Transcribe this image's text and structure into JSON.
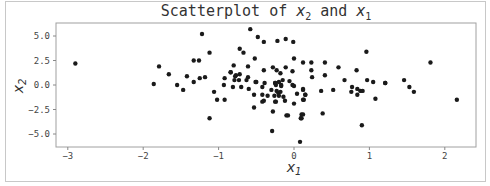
{
  "chart_data": {
    "type": "scatter",
    "title": "Scatterplot of x2 and x1",
    "xlabel": "x1",
    "ylabel": "x2",
    "xlim": [
      -3.15,
      2.4
    ],
    "ylim": [
      -6.3,
      6.3
    ],
    "xticks": [
      -3,
      -2,
      -1,
      0,
      1,
      2
    ],
    "yticks": [
      5.0,
      2.5,
      0.0,
      -2.5,
      -5.0
    ],
    "xtick_labels": [
      "−3",
      "−2",
      "−1",
      "0",
      "1",
      "2"
    ],
    "ytick_labels": [
      "5.0",
      "2.5",
      "0.0",
      "−2.5",
      "−5.0"
    ],
    "grid": false,
    "marker_color": "#1a1a1a",
    "points": [
      [
        -2.9,
        2.2
      ],
      [
        -1.86,
        0.1
      ],
      [
        -1.79,
        1.9
      ],
      [
        -1.66,
        1.1
      ],
      [
        -1.55,
        0.0
      ],
      [
        -1.47,
        -0.5
      ],
      [
        -1.42,
        0.9
      ],
      [
        -1.33,
        0.3
      ],
      [
        -1.33,
        2.5
      ],
      [
        -1.26,
        2.5
      ],
      [
        -1.22,
        5.2
      ],
      [
        -1.12,
        3.3
      ],
      [
        -1.25,
        0.7
      ],
      [
        -1.18,
        0.8
      ],
      [
        -1.06,
        -0.7
      ],
      [
        -1.02,
        -1.5
      ],
      [
        -1.12,
        -3.4
      ],
      [
        -0.92,
        -1.5
      ],
      [
        -0.93,
        0.0
      ],
      [
        -0.92,
        0.7
      ],
      [
        -0.84,
        1.3
      ],
      [
        -0.77,
        1.0
      ],
      [
        -0.8,
        2.0
      ],
      [
        -0.73,
        0.5
      ],
      [
        -0.79,
        0.5
      ],
      [
        -0.58,
        5.7
      ],
      [
        -0.48,
        4.9
      ],
      [
        -0.4,
        4.4
      ],
      [
        -0.72,
        3.7
      ],
      [
        -0.67,
        3.3
      ],
      [
        -0.52,
        2.7
      ],
      [
        -0.61,
        1.9
      ],
      [
        -0.4,
        1.5
      ],
      [
        -0.84,
        1.3
      ],
      [
        -0.72,
        1.1
      ],
      [
        -0.78,
        0.9
      ],
      [
        -0.61,
        0.8
      ],
      [
        -0.5,
        0.3
      ],
      [
        -0.7,
        -0.2
      ],
      [
        -0.63,
        0.5
      ],
      [
        -0.81,
        -0.2
      ],
      [
        -0.6,
        -0.4
      ],
      [
        -0.42,
        -0.2
      ],
      [
        -0.39,
        0.2
      ],
      [
        -0.51,
        0.3
      ],
      [
        -0.53,
        -1.0
      ],
      [
        -0.42,
        -1.7
      ],
      [
        -0.4,
        -1.6
      ],
      [
        -0.42,
        -1.0
      ],
      [
        -0.53,
        -2.3
      ],
      [
        -0.23,
        1.5
      ],
      [
        -0.11,
        1.8
      ],
      [
        -0.2,
        0.3
      ],
      [
        -0.24,
        0.0
      ],
      [
        -0.21,
        -0.8
      ],
      [
        -0.26,
        -1.1
      ],
      [
        -0.3,
        -0.5
      ],
      [
        -0.25,
        -1.7
      ],
      [
        -0.18,
        -0.7
      ],
      [
        -0.14,
        -1.2
      ],
      [
        -0.12,
        -1.6
      ],
      [
        -0.22,
        4.5
      ],
      [
        -0.11,
        4.7
      ],
      [
        -0.01,
        4.4
      ],
      [
        0.0,
        2.7
      ],
      [
        0.12,
        2.3
      ],
      [
        -0.28,
        1.8
      ],
      [
        -0.02,
        1.4
      ],
      [
        -0.18,
        1.2
      ],
      [
        -0.15,
        0.5
      ],
      [
        -0.06,
        0.4
      ],
      [
        -0.25,
        0.2
      ],
      [
        -0.17,
        0.0
      ],
      [
        -0.02,
        0.0
      ],
      [
        -0.25,
        0.2
      ],
      [
        -0.17,
        -0.1
      ],
      [
        -0.23,
        -0.6
      ],
      [
        -0.2,
        -1.1
      ],
      [
        -0.35,
        -1.1
      ],
      [
        -0.24,
        -1.7
      ],
      [
        0.0,
        -0.1
      ],
      [
        0.04,
        -0.9
      ],
      [
        0.12,
        -0.5
      ],
      [
        0.15,
        -1.0
      ],
      [
        0.13,
        -1.5
      ],
      [
        0.0,
        -1.9
      ],
      [
        -0.28,
        -2.7
      ],
      [
        -0.1,
        -3.1
      ],
      [
        -0.08,
        -3.1
      ],
      [
        0.1,
        -3.0
      ],
      [
        0.09,
        -3.4
      ],
      [
        -0.29,
        -4.7
      ],
      [
        0.08,
        -5.8
      ],
      [
        0.23,
        2.3
      ],
      [
        0.23,
        1.5
      ],
      [
        0.24,
        0.8
      ],
      [
        0.41,
        2.3
      ],
      [
        0.59,
        1.8
      ],
      [
        0.41,
        1.0
      ],
      [
        0.83,
        1.5
      ],
      [
        0.67,
        0.5
      ],
      [
        0.96,
        3.4
      ],
      [
        0.97,
        0.5
      ],
      [
        1.05,
        0.3
      ],
      [
        1.21,
        0.2
      ],
      [
        0.12,
        -0.4
      ],
      [
        0.15,
        -1.0
      ],
      [
        0.12,
        -1.5
      ],
      [
        0.36,
        -0.6
      ],
      [
        0.52,
        -0.5
      ],
      [
        0.77,
        -0.2
      ],
      [
        0.76,
        -0.7
      ],
      [
        0.84,
        -0.4
      ],
      [
        0.88,
        -0.6
      ],
      [
        0.91,
        -0.6
      ],
      [
        0.84,
        -1.0
      ],
      [
        1.08,
        -1.4
      ],
      [
        0.38,
        -2.9
      ],
      [
        0.12,
        -3.0
      ],
      [
        0.1,
        -3.4
      ],
      [
        0.9,
        -4.1
      ],
      [
        1.21,
        0.2
      ],
      [
        1.81,
        2.3
      ],
      [
        1.46,
        0.5
      ],
      [
        1.53,
        -0.2
      ],
      [
        1.59,
        -0.7
      ],
      [
        2.16,
        -1.5
      ]
    ]
  }
}
